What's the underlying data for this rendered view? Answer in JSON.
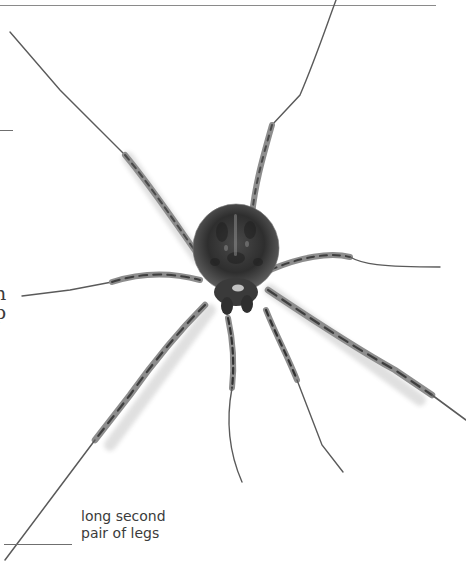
{
  "page": {
    "top_rule": true,
    "cut_off_text_fragments": [
      "n",
      "p"
    ]
  },
  "figure": {
    "icon": "spider-illustration",
    "colors": {
      "background": "#ffffff",
      "leg_dark": "#3d3d3d",
      "leg_light": "#b9b9b9",
      "body": "#2e2e2e",
      "rule": "#8a8a8a",
      "label_text": "#3b3b3b"
    }
  },
  "annotation": {
    "line1": "long second",
    "line2": "pair of legs"
  }
}
